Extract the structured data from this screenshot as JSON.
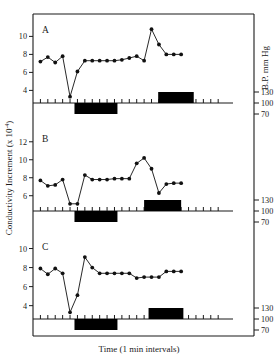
{
  "figure": {
    "x_axis_label": "Time (1 min intervals)",
    "y_axis_label_main": "Conductivity Increment (",
    "y_axis_label_exp_base": "x 10",
    "y_axis_label_exp_sup": "-4",
    "y_axis_label_close": ")",
    "right_axis_label": "B.P. mm Hg"
  },
  "chart_data": {
    "type": "line",
    "title": "",
    "xlabel": "Time (1 min intervals)",
    "ylabel": "Conductivity Increment (x10-4)",
    "y2label": "B.P. mm Hg",
    "grid": false,
    "legend": false,
    "xlim": [
      0,
      27
    ],
    "panels": [
      {
        "id": "A",
        "ylim": [
          2.6,
          11.6
        ],
        "yticks": [
          10,
          8,
          6,
          4
        ],
        "ytick_labels": [
          "10",
          "8",
          "6",
          "4"
        ],
        "bp_ticks": [
          130,
          100,
          70
        ],
        "bp_tick_labels": [
          "130",
          "100",
          "70"
        ],
        "x": [
          1,
          2,
          3,
          4,
          5,
          6,
          7,
          8,
          9,
          10,
          11,
          12,
          13,
          14,
          15,
          16,
          17,
          18,
          19,
          20,
          21,
          22,
          23,
          24
        ],
        "values": [
          7.2,
          7.7,
          7.1,
          7.8,
          3.3,
          6.1,
          7.3,
          7.3,
          7.3,
          7.3,
          7.3,
          7.4,
          7.6,
          7.8,
          7.3,
          10.8,
          9.1,
          8.0,
          8.0,
          8.0
        ],
        "bars": [
          {
            "name": "lower-stimulus-bar",
            "x_start": 5.6,
            "x_end": 11.4,
            "side": "below"
          },
          {
            "name": "upper-stimulus-bar",
            "x_start": 16.9,
            "x_end": 21.7,
            "side": "above"
          }
        ]
      },
      {
        "id": "B",
        "ylim": [
          4.3,
          13.2
        ],
        "yticks": [
          12,
          10,
          8,
          6
        ],
        "ytick_labels": [
          "12",
          "10",
          "8",
          "6"
        ],
        "bp_ticks": [
          130,
          100,
          70
        ],
        "bp_tick_labels": [
          "130",
          "100",
          "70"
        ],
        "x": [
          1,
          2,
          3,
          4,
          5,
          6,
          7,
          8,
          9,
          10,
          11,
          12,
          13,
          14,
          15,
          16,
          17,
          18,
          19,
          20,
          21,
          22,
          23
        ],
        "values": [
          7.7,
          7.1,
          7.2,
          7.8,
          5.1,
          5.1,
          8.3,
          7.8,
          7.8,
          7.8,
          7.9,
          7.9,
          7.9,
          9.6,
          10.2,
          9.0,
          6.3,
          7.3,
          7.4,
          7.4
        ],
        "bars": [
          {
            "name": "lower-stimulus-bar",
            "x_start": 5.6,
            "x_end": 11.4,
            "side": "below"
          },
          {
            "name": "upper-stimulus-bar",
            "x_start": 15.0,
            "x_end": 20.0,
            "side": "above"
          }
        ]
      },
      {
        "id": "C",
        "ylim": [
          2.6,
          11.0
        ],
        "yticks": [
          10,
          8,
          6,
          4
        ],
        "ytick_labels": [
          "10",
          "8",
          "6",
          "4"
        ],
        "bp_ticks": [
          130,
          100,
          70
        ],
        "bp_tick_labels": [
          "130",
          "100",
          "70"
        ],
        "x": [
          1,
          2,
          3,
          4,
          5,
          6,
          7,
          8,
          9,
          10,
          11,
          12,
          13,
          14,
          15,
          16,
          17,
          18,
          19,
          20,
          21,
          22,
          23,
          24
        ],
        "values": [
          7.9,
          7.3,
          7.9,
          7.4,
          3.3,
          5.1,
          9.1,
          8.0,
          7.4,
          7.4,
          7.4,
          7.4,
          7.4,
          6.9,
          7.0,
          7.0,
          7.0,
          7.6,
          7.6,
          7.6
        ],
        "bars": [
          {
            "name": "lower-stimulus-bar",
            "x_start": 5.6,
            "x_end": 11.4,
            "side": "below"
          },
          {
            "name": "upper-stimulus-bar",
            "x_start": 15.6,
            "x_end": 20.3,
            "side": "above"
          }
        ]
      }
    ]
  }
}
